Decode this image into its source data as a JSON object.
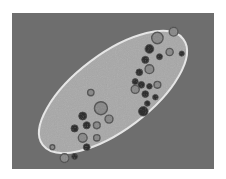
{
  "image": {
    "subject": "paramecium micrograph",
    "description": "Elongated single-celled organism with bright membrane outline on gray background, containing dark food vacuoles and granules",
    "colors": {
      "background": "#6e6e6e",
      "cell_fill": "#a9a9a9",
      "membrane": "#e6e6e6",
      "granule_dark": "#2e2e2e",
      "vacuole_ring": "#555555"
    },
    "granules": [
      {
        "x": 0.72,
        "y": 0.16,
        "r": 0.028,
        "kind": "ring"
      },
      {
        "x": 0.8,
        "y": 0.12,
        "r": 0.022,
        "kind": "ring"
      },
      {
        "x": 0.68,
        "y": 0.23,
        "r": 0.022,
        "kind": "dark"
      },
      {
        "x": 0.66,
        "y": 0.3,
        "r": 0.018,
        "kind": "dark"
      },
      {
        "x": 0.73,
        "y": 0.28,
        "r": 0.015,
        "kind": "dark"
      },
      {
        "x": 0.78,
        "y": 0.25,
        "r": 0.018,
        "kind": "ring"
      },
      {
        "x": 0.84,
        "y": 0.26,
        "r": 0.013,
        "kind": "dark"
      },
      {
        "x": 0.68,
        "y": 0.36,
        "r": 0.022,
        "kind": "ring"
      },
      {
        "x": 0.63,
        "y": 0.38,
        "r": 0.017,
        "kind": "dark"
      },
      {
        "x": 0.61,
        "y": 0.44,
        "r": 0.015,
        "kind": "dark"
      },
      {
        "x": 0.64,
        "y": 0.46,
        "r": 0.017,
        "kind": "dark"
      },
      {
        "x": 0.61,
        "y": 0.49,
        "r": 0.02,
        "kind": "ring"
      },
      {
        "x": 0.68,
        "y": 0.47,
        "r": 0.014,
        "kind": "dark"
      },
      {
        "x": 0.72,
        "y": 0.46,
        "r": 0.017,
        "kind": "ring"
      },
      {
        "x": 0.66,
        "y": 0.52,
        "r": 0.017,
        "kind": "dark"
      },
      {
        "x": 0.71,
        "y": 0.54,
        "r": 0.014,
        "kind": "dark"
      },
      {
        "x": 0.67,
        "y": 0.58,
        "r": 0.014,
        "kind": "dark"
      },
      {
        "x": 0.65,
        "y": 0.63,
        "r": 0.024,
        "kind": "dark"
      },
      {
        "x": 0.39,
        "y": 0.51,
        "r": 0.016,
        "kind": "ring"
      },
      {
        "x": 0.44,
        "y": 0.61,
        "r": 0.032,
        "kind": "ring"
      },
      {
        "x": 0.48,
        "y": 0.68,
        "r": 0.02,
        "kind": "ring"
      },
      {
        "x": 0.35,
        "y": 0.66,
        "r": 0.02,
        "kind": "dark"
      },
      {
        "x": 0.37,
        "y": 0.72,
        "r": 0.018,
        "kind": "dark"
      },
      {
        "x": 0.42,
        "y": 0.72,
        "r": 0.017,
        "kind": "ring"
      },
      {
        "x": 0.31,
        "y": 0.74,
        "r": 0.018,
        "kind": "dark"
      },
      {
        "x": 0.35,
        "y": 0.8,
        "r": 0.022,
        "kind": "ring"
      },
      {
        "x": 0.42,
        "y": 0.8,
        "r": 0.016,
        "kind": "ring"
      },
      {
        "x": 0.37,
        "y": 0.86,
        "r": 0.017,
        "kind": "dark"
      },
      {
        "x": 0.31,
        "y": 0.92,
        "r": 0.015,
        "kind": "dark"
      },
      {
        "x": 0.26,
        "y": 0.93,
        "r": 0.022,
        "kind": "ring"
      },
      {
        "x": 0.2,
        "y": 0.86,
        "r": 0.012,
        "kind": "ring"
      }
    ]
  }
}
